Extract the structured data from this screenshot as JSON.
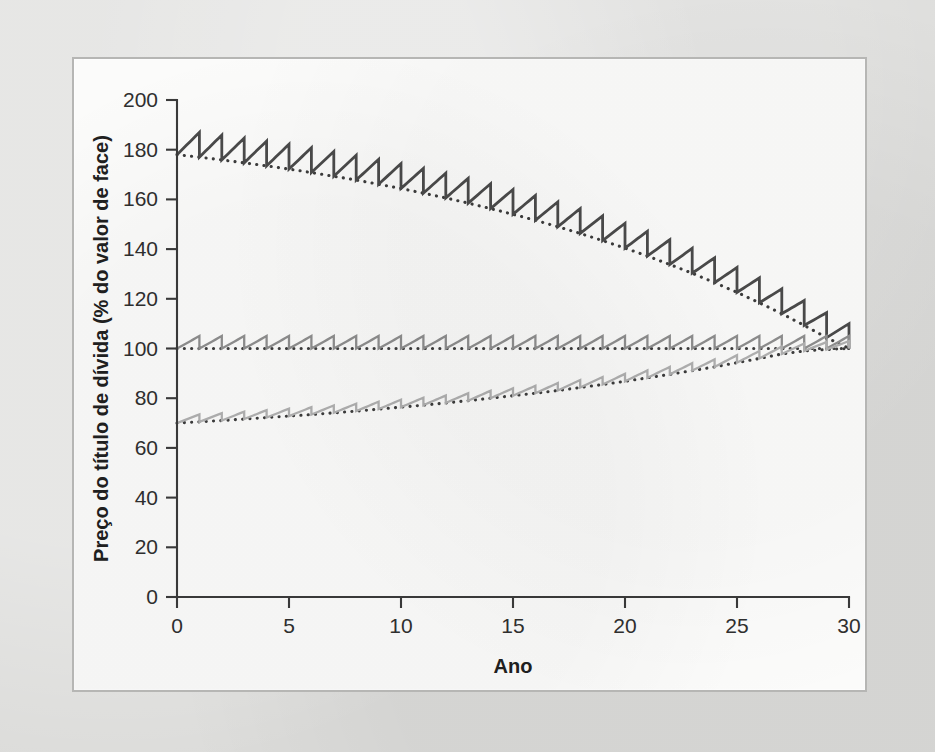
{
  "figure": {
    "background_color": "#dcdcda",
    "panel_color": "#fbfbfa",
    "panel_border_color": "#b6b6b4"
  },
  "chart_data": {
    "type": "line",
    "title": "",
    "subtitle": "",
    "xlabel": "Ano",
    "ylabel": "Preço do título de dívida (% do valor de face)",
    "xlim": [
      0,
      30
    ],
    "ylim": [
      0,
      200
    ],
    "xticks": [
      0,
      5,
      10,
      15,
      20,
      25,
      30
    ],
    "yticks": [
      0,
      20,
      40,
      60,
      80,
      100,
      120,
      140,
      160,
      180,
      200
    ],
    "xtick_labels": [
      "0",
      "5",
      "10",
      "15",
      "20",
      "25",
      "30"
    ],
    "ytick_labels": [
      "0",
      "20",
      "40",
      "60",
      "80",
      "100",
      "120",
      "140",
      "160",
      "180",
      "200"
    ],
    "grid": false,
    "legend_position": "inline-annotations",
    "annotations": [
      {
        "text": "Taxa de cupom de 10%",
        "x": 1.2,
        "y": 152
      },
      {
        "text": "Taxa de cupom de 5%",
        "x": 1.2,
        "y": 110
      },
      {
        "text": "Taxa de cupom de 3%",
        "x": 1.6,
        "y": 59
      },
      {
        "text": "Cupom zero",
        "x": 1.8,
        "y": 16
      }
    ],
    "series": [
      {
        "name": "Taxa de cupom de 10%",
        "coupon_rate_pct": 10,
        "color": "#4a4a4a",
        "style": "sawtooth",
        "trend_style": "dotted",
        "start_value": 178,
        "end_value": 100,
        "sawtooth_amplitude_start": 10,
        "x": [
          0,
          1,
          2,
          3,
          4,
          5,
          6,
          7,
          8,
          9,
          10,
          11,
          12,
          13,
          14,
          15,
          16,
          17,
          18,
          19,
          20,
          21,
          22,
          23,
          24,
          25,
          26,
          27,
          28,
          29,
          30
        ],
        "values": [
          178.0,
          177.0,
          175.9,
          174.7,
          173.5,
          172.2,
          170.8,
          169.3,
          167.8,
          166.1,
          164.4,
          162.5,
          160.6,
          158.5,
          156.3,
          154.0,
          151.6,
          149.0,
          146.3,
          143.4,
          140.4,
          137.2,
          133.8,
          130.3,
          126.5,
          122.6,
          118.4,
          114.0,
          109.3,
          104.4,
          100.0
        ]
      },
      {
        "name": "Taxa de cupom de 5%",
        "coupon_rate_pct": 5,
        "color": "#8e8e8e",
        "style": "sawtooth",
        "trend_style": "dotted",
        "start_value": 100,
        "end_value": 100,
        "sawtooth_amplitude_start": 5,
        "x": [
          0,
          1,
          2,
          3,
          4,
          5,
          6,
          7,
          8,
          9,
          10,
          11,
          12,
          13,
          14,
          15,
          16,
          17,
          18,
          19,
          20,
          21,
          22,
          23,
          24,
          25,
          26,
          27,
          28,
          29,
          30
        ],
        "values": [
          100,
          100,
          100,
          100,
          100,
          100,
          100,
          100,
          100,
          100,
          100,
          100,
          100,
          100,
          100,
          100,
          100,
          100,
          100,
          100,
          100,
          100,
          100,
          100,
          100,
          100,
          100,
          100,
          100,
          100,
          100
        ]
      },
      {
        "name": "Taxa de cupom de 3%",
        "coupon_rate_pct": 3,
        "color": "#b0b0b0",
        "style": "sawtooth",
        "trend_style": "dotted",
        "start_value": 70,
        "end_value": 100,
        "sawtooth_amplitude_start": 3,
        "x": [
          0,
          1,
          2,
          3,
          4,
          5,
          6,
          7,
          8,
          9,
          10,
          11,
          12,
          13,
          14,
          15,
          16,
          17,
          18,
          19,
          20,
          21,
          22,
          23,
          24,
          25,
          26,
          27,
          28,
          29,
          30
        ],
        "values": [
          70.0,
          70.5,
          71.0,
          71.6,
          72.2,
          72.8,
          73.4,
          74.1,
          74.8,
          75.6,
          76.4,
          77.2,
          78.1,
          79.0,
          80.0,
          81.0,
          82.0,
          83.1,
          84.3,
          85.5,
          86.8,
          88.2,
          89.6,
          91.1,
          92.6,
          94.3,
          96.0,
          97.8,
          99.0,
          99.6,
          100.0
        ]
      },
      {
        "name": "Cupom zero",
        "coupon_rate_pct": 0,
        "color": "#cfcfcf",
        "style": "smooth",
        "trend_style": "none",
        "start_value": 23,
        "end_value": 100,
        "x": [
          0,
          1,
          2,
          3,
          4,
          5,
          6,
          7,
          8,
          9,
          10,
          11,
          12,
          13,
          14,
          15,
          16,
          17,
          18,
          19,
          20,
          21,
          22,
          23,
          24,
          25,
          26,
          27,
          28,
          29,
          30
        ],
        "values": [
          23.1,
          24.3,
          25.5,
          26.7,
          28.1,
          29.5,
          31.0,
          32.5,
          34.1,
          35.8,
          37.7,
          39.5,
          41.5,
          43.6,
          45.8,
          48.1,
          50.5,
          53.0,
          55.7,
          58.5,
          61.4,
          64.5,
          67.7,
          71.1,
          74.7,
          78.4,
          82.4,
          86.5,
          90.8,
          95.3,
          100.0
        ]
      }
    ]
  }
}
